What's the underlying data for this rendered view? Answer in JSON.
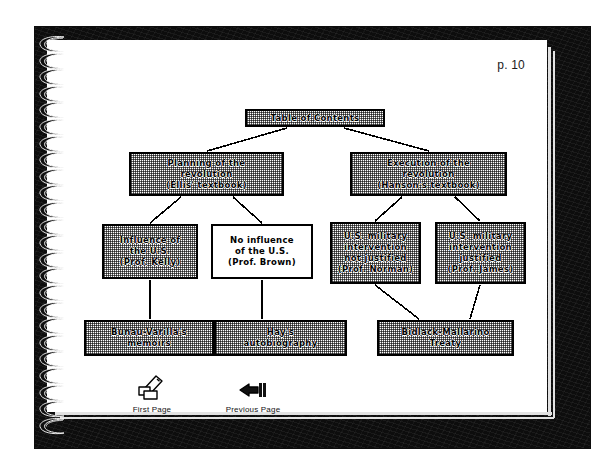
{
  "document": {
    "page_label": "p. 10",
    "binding": "spiral-notebook"
  },
  "diagram": {
    "type": "tree",
    "title": "Table of Contents",
    "nodes": [
      {
        "id": "toc",
        "label": "Table of Contents",
        "fill": "dither-gray",
        "level": 0
      },
      {
        "id": "planning",
        "label": "Planning of the\nrevolution\n(Ellis' textbook)",
        "fill": "dither-gray",
        "level": 1
      },
      {
        "id": "execution",
        "label": "Execution of the\nrevolution\n(Hanson's textbook)",
        "fill": "dither-gray",
        "level": 1
      },
      {
        "id": "influence",
        "label": "Influence of\nthe U.S.\n(Prof. Kelly)",
        "fill": "dither-gray",
        "level": 2
      },
      {
        "id": "noinfluence",
        "label": "No influence\nof the U.S.\n(Prof. Brown)",
        "fill": "white",
        "level": 2
      },
      {
        "id": "notjustified",
        "label": "U.S. military\nintervention\nnot justified\n(Prof. Norman)",
        "fill": "dither-gray",
        "level": 2
      },
      {
        "id": "justified",
        "label": "U.S. military\nintervention\njustified\n(Prof. James)",
        "fill": "dither-gray",
        "level": 2
      },
      {
        "id": "bunau",
        "label": "Bunau-Varilla's\nmemoirs",
        "fill": "dither-gray",
        "level": 3
      },
      {
        "id": "hay",
        "label": "Hay's\nautobiography",
        "fill": "dither-gray",
        "level": 3
      },
      {
        "id": "bidlack",
        "label": "Bidlack-Mallarino\nTreaty",
        "fill": "dither-gray",
        "level": 3
      }
    ],
    "edges": [
      {
        "from": "toc",
        "to": "planning"
      },
      {
        "from": "toc",
        "to": "execution"
      },
      {
        "from": "planning",
        "to": "influence"
      },
      {
        "from": "planning",
        "to": "noinfluence"
      },
      {
        "from": "execution",
        "to": "notjustified"
      },
      {
        "from": "execution",
        "to": "justified"
      },
      {
        "from": "influence",
        "to": "bunau"
      },
      {
        "from": "noinfluence",
        "to": "hay"
      },
      {
        "from": "notjustified",
        "to": "bidlack"
      },
      {
        "from": "justified",
        "to": "bidlack"
      }
    ]
  },
  "navigation": {
    "buttons": [
      {
        "id": "first",
        "label": "First Page",
        "icon": "hand-writing-icon"
      },
      {
        "id": "previous",
        "label": "Previous Page",
        "icon": "hand-pointing-left-icon"
      }
    ]
  },
  "colors": {
    "cover": "#0d0d0d",
    "page": "#ffffff",
    "ink": "#000000",
    "page_edge": "#e2e2e2"
  }
}
